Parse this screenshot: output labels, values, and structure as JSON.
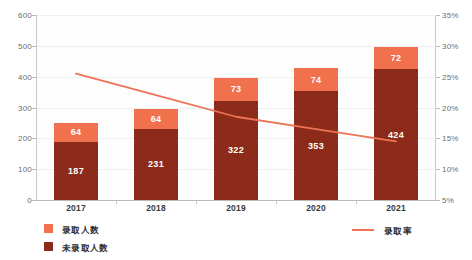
{
  "chart_data": {
    "type": "bar",
    "title": "",
    "subtitle": "",
    "xlabel": "",
    "ylabel": "",
    "categories": [
      "2017",
      "2018",
      "2019",
      "2020",
      "2021"
    ],
    "series": [
      {
        "name": "录取人数",
        "type": "bar",
        "stack": "total",
        "color": "#F0714B",
        "values": [
          64,
          64,
          73,
          74,
          72
        ],
        "axis": "left"
      },
      {
        "name": "未录取人数",
        "type": "bar",
        "stack": "total",
        "color": "#8C2B19",
        "values": [
          187,
          231,
          322,
          353,
          424
        ],
        "axis": "left"
      },
      {
        "name": "录取率",
        "type": "line",
        "color": "#EE7355",
        "values": [
          25.5,
          22.0,
          18.5,
          16.5,
          14.5
        ],
        "unit": "%",
        "axis": "right"
      }
    ],
    "left_axis": {
      "ticks": [
        "0",
        "100",
        "200",
        "300",
        "400",
        "500",
        "600"
      ],
      "ylim": [
        0,
        600
      ]
    },
    "right_axis": {
      "ticks": [
        "5%",
        "10%",
        "15%",
        "20%",
        "25%",
        "30%",
        "35%"
      ],
      "ylim": [
        5,
        35
      ]
    },
    "grid": true,
    "legend_position": "bottom"
  },
  "legend": {
    "items": [
      {
        "label": "录取人数",
        "color": "#F0714B",
        "marker": "square"
      },
      {
        "label": "未录取人数",
        "color": "#8C2B19",
        "marker": "square"
      }
    ],
    "line_item": {
      "label": "录取率",
      "color": "#EE7355",
      "marker": "line"
    }
  },
  "colors": {
    "accepted": "#F0714B",
    "not_accepted": "#8C2B19",
    "rate_line": "#EE7355",
    "axis": "#b8b8b8",
    "grid": "#efefef",
    "tick_text": "#6d6d6d",
    "label_text": "#2f2f2f"
  }
}
